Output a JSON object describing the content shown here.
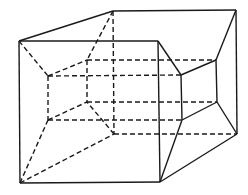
{
  "diagram": {
    "type": "tesseract-projection",
    "stroke_color": "#1a1a1a",
    "background": "#ffffff",
    "vertices": {
      "outer_front_tl": [
        19,
        41
      ],
      "outer_front_tr": [
        158,
        41
      ],
      "outer_front_bl": [
        20,
        183
      ],
      "outer_front_br": [
        160,
        182
      ],
      "outer_back_tl": [
        113,
        11
      ],
      "outer_back_tr": [
        236,
        10
      ],
      "outer_back_bl": [
        114,
        134
      ],
      "outer_back_br": [
        237,
        134
      ],
      "inner_front_tl": [
        48,
        76
      ],
      "inner_front_tr": [
        181,
        75
      ],
      "inner_front_bl": [
        48,
        120
      ],
      "inner_front_br": [
        182,
        120
      ],
      "inner_back_tl": [
        87,
        60
      ],
      "inner_back_tr": [
        216,
        60
      ],
      "inner_back_bl": [
        87,
        102
      ],
      "inner_back_br": [
        217,
        102
      ]
    }
  }
}
